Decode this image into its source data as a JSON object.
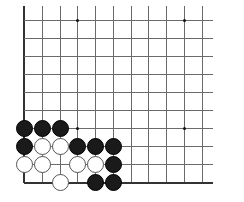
{
  "board": {
    "description": "Go board corner fragment (lower-left), open on top and right",
    "columns_x": [
      24,
      42,
      60,
      77,
      95,
      113,
      131,
      148,
      166,
      184,
      202
    ],
    "rows_y": [
      20,
      38,
      56,
      74,
      92,
      110,
      128,
      146,
      164,
      182
    ],
    "line_color": "#6a6a6a",
    "edge_color": "#333333",
    "star_points": [
      {
        "col": 3,
        "row": 0
      },
      {
        "col": 9,
        "row": 0
      },
      {
        "col": 3,
        "row": 6
      },
      {
        "col": 9,
        "row": 6
      }
    ],
    "stones": [
      {
        "color": "black",
        "col": 0,
        "row": 6
      },
      {
        "color": "black",
        "col": 1,
        "row": 6
      },
      {
        "color": "black",
        "col": 2,
        "row": 6
      },
      {
        "color": "black",
        "col": 0,
        "row": 7
      },
      {
        "color": "white",
        "col": 1,
        "row": 7
      },
      {
        "color": "white",
        "col": 2,
        "row": 7
      },
      {
        "color": "black",
        "col": 3,
        "row": 7
      },
      {
        "color": "black",
        "col": 4,
        "row": 7
      },
      {
        "color": "black",
        "col": 5,
        "row": 7
      },
      {
        "color": "white",
        "col": 0,
        "row": 8
      },
      {
        "color": "white",
        "col": 1,
        "row": 8
      },
      {
        "color": "white",
        "col": 3,
        "row": 8
      },
      {
        "color": "white",
        "col": 4,
        "row": 8
      },
      {
        "color": "black",
        "col": 5,
        "row": 8
      },
      {
        "color": "white",
        "col": 2,
        "row": 9
      },
      {
        "color": "black",
        "col": 4,
        "row": 9
      },
      {
        "color": "black",
        "col": 5,
        "row": 9
      }
    ]
  }
}
